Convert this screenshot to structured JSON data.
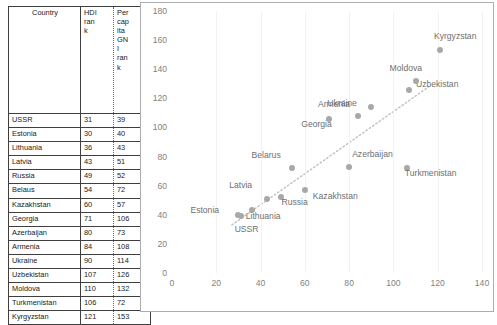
{
  "table": {
    "headers": {
      "country": "Country",
      "hdi_rank": "HDI rank",
      "gni_rank": "Per capita GNI rank"
    },
    "rows": [
      {
        "country": "USSR",
        "hdi_rank": "31",
        "gni_rank": "39"
      },
      {
        "country": "Estonia",
        "hdi_rank": "30",
        "gni_rank": "40"
      },
      {
        "country": "Lithuania",
        "hdi_rank": "36",
        "gni_rank": "43"
      },
      {
        "country": "Latvia",
        "hdi_rank": "43",
        "gni_rank": "51"
      },
      {
        "country": "Russia",
        "hdi_rank": "49",
        "gni_rank": "52"
      },
      {
        "country": "Belaus",
        "hdi_rank": "54",
        "gni_rank": "72"
      },
      {
        "country": "Kazakhstan",
        "hdi_rank": "60",
        "gni_rank": "57"
      },
      {
        "country": "Georgia",
        "hdi_rank": "71",
        "gni_rank": "106"
      },
      {
        "country": "Azerbaijan",
        "hdi_rank": "80",
        "gni_rank": "73"
      },
      {
        "country": "Armenia",
        "hdi_rank": "84",
        "gni_rank": "108"
      },
      {
        "country": "Ukraine",
        "hdi_rank": "90",
        "gni_rank": "114"
      },
      {
        "country": "Uzbekistan",
        "hdi_rank": "107",
        "gni_rank": "126"
      },
      {
        "country": "Moldova",
        "hdi_rank": "110",
        "gni_rank": "132"
      },
      {
        "country": "Turkmenistan",
        "hdi_rank": "106",
        "gni_rank": "72"
      },
      {
        "country": "Kyrgyzstan",
        "hdi_rank": "121",
        "gni_rank": "153"
      }
    ]
  },
  "chart_data": {
    "type": "scatter",
    "title": "",
    "xlabel": "",
    "ylabel": "",
    "xlim": [
      0,
      140
    ],
    "ylim": [
      0,
      180
    ],
    "xticks": [
      0,
      20,
      40,
      60,
      80,
      100,
      120,
      140
    ],
    "yticks": [
      0,
      20,
      40,
      60,
      80,
      100,
      120,
      140,
      160,
      180
    ],
    "grid": "vertical-only",
    "legend": "none",
    "marker_color": "#a8a8a8",
    "trendline": {
      "style": "dotted",
      "color": "#c0c0c0",
      "x0": 27,
      "y0": 33,
      "x1": 116,
      "y1": 128
    },
    "points": [
      {
        "label": "USSR",
        "x": 31,
        "y": 39,
        "label_dx": -6,
        "label_dy": 13
      },
      {
        "label": "Estonia",
        "x": 30,
        "y": 40,
        "label_dx": -48,
        "label_dy": -5
      },
      {
        "label": "Lithuania",
        "x": 36,
        "y": 43,
        "label_dx": -6,
        "label_dy": 6
      },
      {
        "label": "Latvia",
        "x": 43,
        "y": 51,
        "label_dx": -38,
        "label_dy": -14
      },
      {
        "label": "Russia",
        "x": 49,
        "y": 52,
        "label_dx": 1,
        "label_dy": 5
      },
      {
        "label": "Belarus",
        "x": 54,
        "y": 72,
        "label_dx": -40,
        "label_dy": -13
      },
      {
        "label": "Kazakhstan",
        "x": 60,
        "y": 57,
        "label_dx": 8,
        "label_dy": 6
      },
      {
        "label": "Georgia",
        "x": 71,
        "y": 106,
        "label_dx": -28,
        "label_dy": 5
      },
      {
        "label": "Azerbaijan",
        "x": 80,
        "y": 73,
        "label_dx": 3,
        "label_dy": -13
      },
      {
        "label": "Armenia",
        "x": 84,
        "y": 108,
        "label_dx": -40,
        "label_dy": -12
      },
      {
        "label": "Ukraine",
        "x": 90,
        "y": 114,
        "label_dx": -44,
        "label_dy": -4
      },
      {
        "label": "Uzbekistan",
        "x": 107,
        "y": 126,
        "label_dx": 7,
        "label_dy": -6
      },
      {
        "label": "Moldova",
        "x": 110,
        "y": 132,
        "label_dx": -26,
        "label_dy": -13
      },
      {
        "label": "Turkmenistan",
        "x": 106,
        "y": 72,
        "label_dx": -2,
        "label_dy": 5,
        "wrap": 10
      },
      {
        "label": "Kyrgyzstan",
        "x": 121,
        "y": 153,
        "label_dx": -6,
        "label_dy": -14
      }
    ]
  }
}
